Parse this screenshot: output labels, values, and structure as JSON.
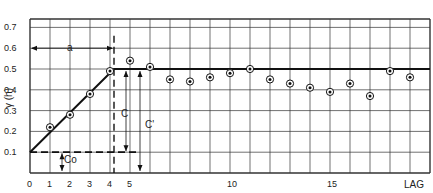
{
  "chart_data": {
    "type": "scatter",
    "title": "",
    "xlabel": "LAG",
    "ylabel": "γ (h)",
    "xlim": [
      0,
      20
    ],
    "ylim": [
      0,
      0.8
    ],
    "grid": true,
    "x_ticks": [
      "0",
      "1",
      "2",
      "3",
      "4",
      "5",
      "10",
      "15"
    ],
    "y_ticks": [
      "0.1",
      "0.2",
      "0.3",
      "0.4",
      "0.5",
      "0.6",
      "0.7"
    ],
    "series": [
      {
        "name": "experimental variogram",
        "x": [
          1,
          2,
          3,
          4,
          5,
          6,
          7,
          8,
          9,
          10,
          11,
          12,
          13,
          14,
          15,
          16,
          17,
          18,
          19
        ],
        "values": [
          0.22,
          0.28,
          0.38,
          0.49,
          0.54,
          0.51,
          0.45,
          0.44,
          0.46,
          0.48,
          0.5,
          0.45,
          0.43,
          0.41,
          0.39,
          0.43,
          0.37,
          0.49,
          0.46
        ]
      },
      {
        "name": "model",
        "x": [
          0,
          4.2,
          20
        ],
        "values": [
          0.1,
          0.5,
          0.5
        ]
      }
    ],
    "annotations": [
      {
        "label": "a",
        "meaning": "range",
        "x_from": 0,
        "x_to": 4.2,
        "y": 0.6
      },
      {
        "label": "C",
        "meaning": "sill minus nugget",
        "x": 4.8,
        "y_from": 0.1,
        "y_to": 0.5
      },
      {
        "label": "C'",
        "meaning": "total sill",
        "x": 5.5,
        "y_from": 0.0,
        "y_to": 0.5
      },
      {
        "label": "Co",
        "meaning": "nugget",
        "x": 1.6,
        "y_from": 0.0,
        "y_to": 0.1
      }
    ]
  },
  "labels": {
    "ylabel": "γ (h)",
    "xlabel": "LAG",
    "a": "a",
    "C": "C",
    "Cprime": "C'",
    "Co": "Co"
  }
}
